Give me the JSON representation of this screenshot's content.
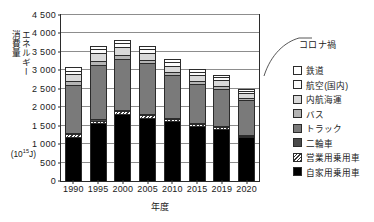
{
  "chart_data": {
    "type": "bar",
    "stacked": true,
    "title": "",
    "xlabel": "年度",
    "ylabel": "エネルギー消費量",
    "yunit_base": "(10",
    "yunit_exp": "15",
    "yunit_tail": "J)",
    "ylim": [
      0,
      4500
    ],
    "ytick_step": 500,
    "grid": true,
    "legend_position": "right",
    "categories": [
      "1990",
      "1995",
      "2000",
      "2005",
      "2010",
      "2015",
      "2019",
      "2020"
    ],
    "ytick_labels": [
      "0",
      "500",
      "1 000",
      "1 500",
      "2 000",
      "2 500",
      "3 000",
      "3 500",
      "4 000",
      "4 500"
    ],
    "ytick_values": [
      0,
      500,
      1000,
      1500,
      2000,
      2500,
      3000,
      3500,
      4000,
      4500
    ],
    "series": [
      {
        "name": "自家用乗用車",
        "key": "jika",
        "color": "#000000",
        "values": [
          1180,
          1560,
          1810,
          1720,
          1620,
          1500,
          1410,
          1190
        ]
      },
      {
        "name": "営業用乗用車",
        "key": "eigyo",
        "color": "#ffffff",
        "pattern": "diagonal-hatch",
        "values": [
          85,
          80,
          75,
          70,
          60,
          55,
          50,
          40
        ]
      },
      {
        "name": "二輪車",
        "key": "nirin",
        "color": "#4a4a4a",
        "values": [
          30,
          30,
          30,
          28,
          26,
          24,
          22,
          20
        ]
      },
      {
        "name": "トラック",
        "key": "truck",
        "color": "#7a7a7a",
        "values": [
          1310,
          1470,
          1400,
          1370,
          1170,
          1040,
          1010,
          950
        ]
      },
      {
        "name": "バス",
        "key": "bus",
        "color": "#b4b4b4",
        "values": [
          110,
          110,
          100,
          95,
          85,
          80,
          75,
          45
        ]
      },
      {
        "name": "内航海運",
        "key": "naiko",
        "color": "#d9d9d9",
        "values": [
          190,
          230,
          220,
          190,
          170,
          160,
          155,
          145
        ]
      },
      {
        "name": "航空(国内)",
        "key": "koku",
        "color": "#fbfbfb",
        "values": [
          75,
          95,
          100,
          95,
          90,
          95,
          90,
          40
        ]
      },
      {
        "name": "鉄道",
        "key": "tetsudo",
        "color": "#ffffff",
        "values": [
          100,
          95,
          85,
          80,
          80,
          75,
          70,
          55
        ]
      }
    ],
    "totals": [
      3080,
      3670,
      3820,
      3648,
      3301,
      3029,
      2883,
      2485
    ],
    "annotation": {
      "text": "コロナ禍",
      "points_to": "2020"
    }
  },
  "legend": {
    "items": [
      {
        "label": "鉄道",
        "fill": "f-tetsudo"
      },
      {
        "label": "航空(国内)",
        "fill": "f-koku"
      },
      {
        "label": "内航海運",
        "fill": "f-naiko"
      },
      {
        "label": "バス",
        "fill": "f-bus"
      },
      {
        "label": "トラック",
        "fill": "f-truck"
      },
      {
        "label": "二輪車",
        "fill": "f-nirin"
      },
      {
        "label": "営業用乗用車",
        "fill": "f-eigyo"
      },
      {
        "label": "自家用乗用車",
        "fill": "f-jika"
      }
    ]
  },
  "axis_title": {
    "ylabel_col1": "エネルギー",
    "ylabel_col2": "消費量"
  }
}
